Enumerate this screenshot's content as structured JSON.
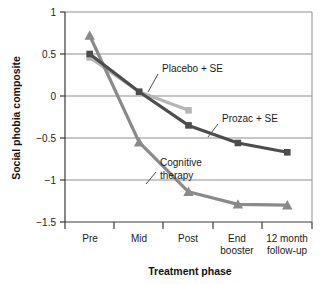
{
  "chart_data": {
    "type": "line",
    "title": "",
    "xlabel": "Treatment phase",
    "ylabel": "Social phobia composite",
    "categories": [
      "Pre",
      "Mid",
      "Post",
      "End booster",
      "12 month follow-up"
    ],
    "category_lines": [
      [
        "Pre"
      ],
      [
        "Mid"
      ],
      [
        "Post"
      ],
      [
        "End",
        "booster"
      ],
      [
        "12 month",
        "follow-up"
      ]
    ],
    "ylim": [
      -1.5,
      1
    ],
    "yticks": [
      1,
      0.5,
      0,
      -0.5,
      -1,
      -1.5
    ],
    "ytick_labels": [
      "1",
      "0.5",
      "0",
      "−0.5",
      "−1",
      "−1.5"
    ],
    "grid": true,
    "legend_position": "inline-annotations",
    "series": [
      {
        "name": "Cognitive therapy",
        "marker": "triangle",
        "color": "#8a8a8a",
        "x": [
          "Pre",
          "Mid",
          "Post",
          "End booster",
          "12 month follow-up"
        ],
        "values": [
          0.72,
          -0.55,
          -1.14,
          -1.29,
          -1.3
        ]
      },
      {
        "name": "Prozac + SE",
        "marker": "square",
        "color": "#4d4d4d",
        "x": [
          "Pre",
          "Mid",
          "Post",
          "End booster",
          "12 month follow-up"
        ],
        "values": [
          0.5,
          0.05,
          -0.35,
          -0.56,
          -0.67
        ]
      },
      {
        "name": "Placebo + SE",
        "marker": "square",
        "color": "#b5b5b5",
        "x": [
          "Pre",
          "Mid",
          "Post"
        ],
        "values": [
          0.46,
          0.05,
          -0.17
        ]
      }
    ],
    "annotations": [
      {
        "name": "Placebo + SE",
        "lines": [
          "Placebo + SE"
        ]
      },
      {
        "name": "Prozac + SE",
        "lines": [
          "Prozac + SE"
        ]
      },
      {
        "name": "Cognitive therapy",
        "lines": [
          "Cognitive",
          "therapy"
        ]
      }
    ]
  }
}
